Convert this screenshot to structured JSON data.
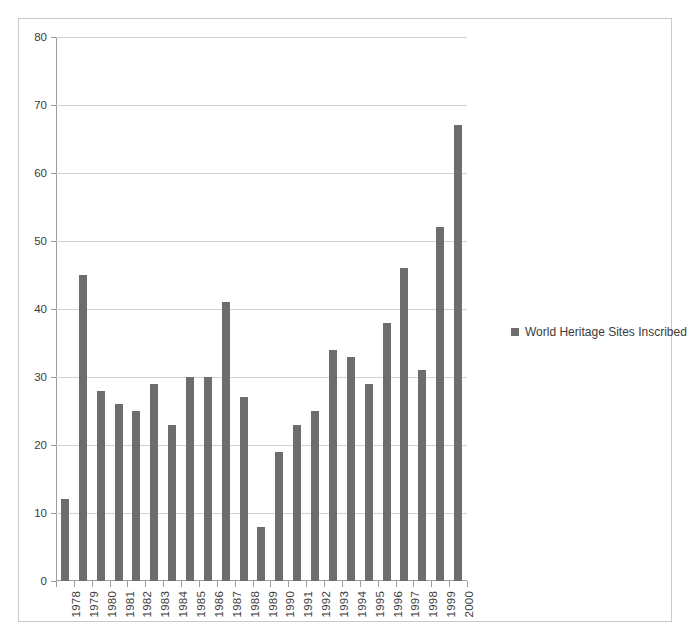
{
  "chart_data": {
    "type": "bar",
    "title": "",
    "subtitle": "",
    "xlabel": "",
    "ylabel": "",
    "categories": [
      "1978",
      "1979",
      "1980",
      "1981",
      "1982",
      "1983",
      "1984",
      "1985",
      "1986",
      "1987",
      "1988",
      "1989",
      "1990",
      "1991",
      "1992",
      "1993",
      "1994",
      "1995",
      "1996",
      "1997",
      "1998",
      "1999",
      "2000"
    ],
    "values": [
      12,
      45,
      28,
      26,
      25,
      29,
      23,
      30,
      30,
      41,
      27,
      8,
      19,
      23,
      25,
      34,
      33,
      29,
      38,
      46,
      31,
      52,
      67
    ],
    "series": [
      {
        "name": "World Heritage Sites Inscribed",
        "values": [
          12,
          45,
          28,
          26,
          25,
          29,
          23,
          30,
          30,
          41,
          27,
          8,
          19,
          23,
          25,
          34,
          33,
          29,
          38,
          46,
          31,
          52,
          67
        ]
      }
    ],
    "ylim": [
      0,
      80
    ],
    "ytick_interval": 10,
    "yticks": [
      0,
      10,
      20,
      30,
      40,
      50,
      60,
      70,
      80
    ],
    "ytick_labels": [
      "0",
      "10",
      "20",
      "30",
      "40",
      "50",
      "60",
      "70",
      "80"
    ],
    "grid": "horizontal",
    "legend_position": "right",
    "legend": [
      "World Heritage Sites Inscribed"
    ],
    "annotations": [],
    "colors": {
      "bar": "#6d6d6d",
      "gridline": "#d0d0d0",
      "axis": "#9e9e9e",
      "text": "#3b3b3b",
      "frame": "#c9c9c9",
      "background": "#ffffff"
    }
  },
  "legend_entry": {
    "label": "World Heritage Sites Inscribed"
  }
}
